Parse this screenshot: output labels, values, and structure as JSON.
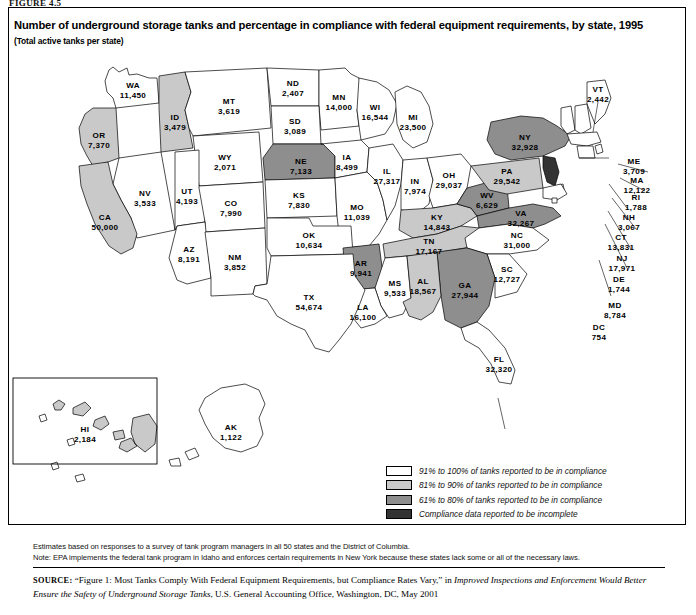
{
  "figure_label": "FIGURE 4.5",
  "title": "Number of underground storage tanks and percentage in compliance with federal equipment requirements, by state, 1995",
  "subtitle": "(Total active tanks per state)",
  "legend": {
    "items": [
      {
        "label": "91% to 100% of tanks reported to be in compliance",
        "color": "#ffffff",
        "key": "c91_100"
      },
      {
        "label": "81% to 90% of tanks reported to be in compliance",
        "color": "#c9c9c9",
        "key": "c81_90"
      },
      {
        "label": "61% to 80% of tanks reported to be in compliance",
        "color": "#8e8e8e",
        "key": "c61_80"
      },
      {
        "label": "Compliance data reported to be incomplete",
        "color": "#333333",
        "key": "incomplete"
      }
    ]
  },
  "notes": [
    "Estimates based on responses to a survey of tank program managers in all 50 states and the District of Columbia.",
    "Note: EPA implements the federal tank program in Idaho and enforces certain requirements in New York because these states lack some or all of the necessary laws."
  ],
  "source": {
    "prefix": "SOURCE:",
    "quoted": "“Figure 1: Most Tanks Comply With Federal Equipment Requirements, but Compliance Rates Vary,” in ",
    "italic": "Improved Inspections and Enforcement Would Better Ensure the Safety of Underground Storage Tanks",
    "tail": ", U.S. General Accounting Office, Washington, DC, May 2001"
  },
  "chart_data": {
    "type": "map",
    "title": "Number of underground storage tanks and percentage in compliance with federal equipment requirements, by state, 1995",
    "unit": "Total active tanks per state",
    "year": 1995,
    "categories": [
      "91% to 100%",
      "81% to 90%",
      "61% to 80%",
      "Compliance data incomplete"
    ],
    "states": [
      {
        "code": "WA",
        "value": "11,450",
        "n": 11450,
        "fill": "c91_100"
      },
      {
        "code": "OR",
        "value": "7,370",
        "n": 7370,
        "fill": "c81_90"
      },
      {
        "code": "ID",
        "value": "3,479",
        "n": 3479,
        "fill": "c81_90"
      },
      {
        "code": "MT",
        "value": "3,619",
        "n": 3619,
        "fill": "c91_100"
      },
      {
        "code": "ND",
        "value": "2,407",
        "n": 2407,
        "fill": "c91_100"
      },
      {
        "code": "MN",
        "value": "14,000",
        "n": 14000,
        "fill": "c91_100"
      },
      {
        "code": "WI",
        "value": "16,544",
        "n": 16544,
        "fill": "c91_100"
      },
      {
        "code": "MI",
        "value": "23,500",
        "n": 23500,
        "fill": "c91_100"
      },
      {
        "code": "SD",
        "value": "3,089",
        "n": 3089,
        "fill": "c91_100"
      },
      {
        "code": "WY",
        "value": "2,071",
        "n": 2071,
        "fill": "c91_100"
      },
      {
        "code": "NE",
        "value": "7,133",
        "n": 7133,
        "fill": "c61_80"
      },
      {
        "code": "IA",
        "value": "8,499",
        "n": 8499,
        "fill": "c91_100"
      },
      {
        "code": "NV",
        "value": "3,533",
        "n": 3533,
        "fill": "c91_100"
      },
      {
        "code": "CA",
        "value": "50,000",
        "n": 50000,
        "fill": "c81_90"
      },
      {
        "code": "UT",
        "value": "4,193",
        "n": 4193,
        "fill": "c91_100"
      },
      {
        "code": "CO",
        "value": "7,990",
        "n": 7990,
        "fill": "c91_100"
      },
      {
        "code": "KS",
        "value": "7,830",
        "n": 7830,
        "fill": "c91_100"
      },
      {
        "code": "MO",
        "value": "11,039",
        "n": 11039,
        "fill": "c91_100"
      },
      {
        "code": "IL",
        "value": "27,317",
        "n": 27317,
        "fill": "c91_100"
      },
      {
        "code": "IN",
        "value": "7,974",
        "n": 7974,
        "fill": "c91_100"
      },
      {
        "code": "OH",
        "value": "29,037",
        "n": 29037,
        "fill": "c91_100"
      },
      {
        "code": "KY",
        "value": "14,843",
        "n": 14843,
        "fill": "c81_90"
      },
      {
        "code": "WV",
        "value": "6,629",
        "n": 6629,
        "fill": "c61_80"
      },
      {
        "code": "VA",
        "value": "32,267",
        "n": 32267,
        "fill": "c61_80"
      },
      {
        "code": "TN",
        "value": "17,167",
        "n": 17167,
        "fill": "c81_90"
      },
      {
        "code": "NC",
        "value": "31,000",
        "n": 31000,
        "fill": "c91_100"
      },
      {
        "code": "SC",
        "value": "12,727",
        "n": 12727,
        "fill": "c91_100"
      },
      {
        "code": "GA",
        "value": "27,944",
        "n": 27944,
        "fill": "c61_80"
      },
      {
        "code": "AZ",
        "value": "8,191",
        "n": 8191,
        "fill": "c91_100"
      },
      {
        "code": "NM",
        "value": "3,852",
        "n": 3852,
        "fill": "c91_100"
      },
      {
        "code": "OK",
        "value": "10,634",
        "n": 10634,
        "fill": "c91_100"
      },
      {
        "code": "AR",
        "value": "9,941",
        "n": 9941,
        "fill": "c61_80"
      },
      {
        "code": "MS",
        "value": "9,533",
        "n": 9533,
        "fill": "c91_100"
      },
      {
        "code": "AL",
        "value": "18,567",
        "n": 18567,
        "fill": "c81_90"
      },
      {
        "code": "LA",
        "value": "16,100",
        "n": 16100,
        "fill": "c91_100"
      },
      {
        "code": "TX",
        "value": "54,674",
        "n": 54674,
        "fill": "c91_100"
      },
      {
        "code": "FL",
        "value": "32,320",
        "n": 32320,
        "fill": "c91_100"
      },
      {
        "code": "NY",
        "value": "32,928",
        "n": 32928,
        "fill": "c61_80"
      },
      {
        "code": "PA",
        "value": "29,542",
        "n": 29542,
        "fill": "c81_90"
      },
      {
        "code": "VT",
        "value": "2,442",
        "n": 2442,
        "fill": "c91_100"
      },
      {
        "code": "ME",
        "value": "3,709",
        "n": 3709,
        "fill": "c91_100"
      },
      {
        "code": "NH",
        "value": "3,067",
        "n": 3067,
        "fill": "c91_100"
      },
      {
        "code": "MA",
        "value": "12,122",
        "n": 12122,
        "fill": "c91_100"
      },
      {
        "code": "RI",
        "value": "1,788",
        "n": 1788,
        "fill": "c91_100"
      },
      {
        "code": "CT",
        "value": "13,831",
        "n": 13831,
        "fill": "c91_100"
      },
      {
        "code": "NJ",
        "value": "17,971",
        "n": 17971,
        "fill": "incomplete"
      },
      {
        "code": "DE",
        "value": "1,744",
        "n": 1744,
        "fill": "c91_100"
      },
      {
        "code": "MD",
        "value": "8,784",
        "n": 8784,
        "fill": "c91_100"
      },
      {
        "code": "DC",
        "value": "754",
        "n": 754,
        "fill": "c91_100"
      },
      {
        "code": "HI",
        "value": "2,184",
        "n": 2184,
        "fill": "c81_90"
      },
      {
        "code": "AK",
        "value": "1,122",
        "n": 1122,
        "fill": "c91_100"
      }
    ]
  }
}
